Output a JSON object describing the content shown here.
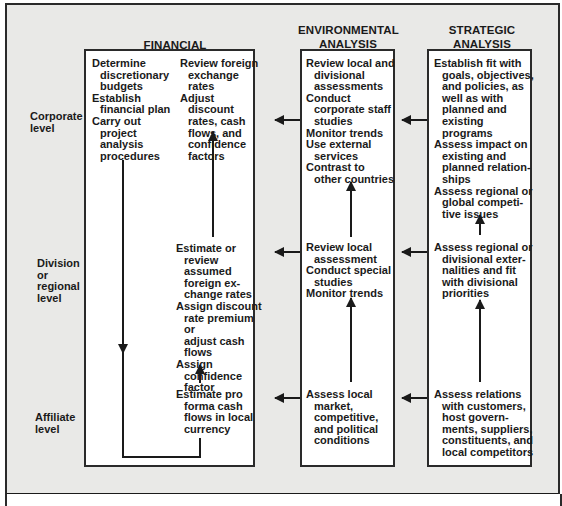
{
  "levels": {
    "corporate": "Corporate\nlevel",
    "division": "Division\nor\nregional\nlevel",
    "affiliate": "Affiliate\nlevel"
  },
  "columns": {
    "financial": {
      "header": "FINANCIAL ANALYSIS",
      "corporate_left": [
        "Determine\ndiscretionary\nbudgets",
        "Establish\nfinancial plan",
        "Carry out\nproject\nanalysis\nprocedures"
      ],
      "corporate_right": [
        "Review foreign\nexchange rates",
        "Adjust discount\nrates, cash\nflows, and\nconfidence\nfactors"
      ],
      "division": [
        "Estimate or\nreview assumed\nforeign ex-\nchange rates",
        "Assign discount\nrate premium or\nadjust cash\nflows",
        "Assign\nconfidence\nfactor"
      ],
      "affiliate": [
        "Estimate pro\nforma cash\nflows in local\ncurrency"
      ]
    },
    "environmental": {
      "header_line1": "ENVIRONMENTAL",
      "header_line2": "ANALYSIS",
      "corporate": [
        "Review local and\ndivisional\nassessments",
        "Conduct\ncorporate staff\nstudies",
        "Monitor trends",
        "Use external\nservices",
        "Contrast to\nother countries"
      ],
      "division": [
        "Review local\nassessment",
        "Conduct special\nstudies",
        "Monitor trends"
      ],
      "affiliate": [
        "Assess local\nmarket,\ncompetitive,\nand political\nconditions"
      ]
    },
    "strategic": {
      "header_line1": "STRATEGIC",
      "header_line2": "ANALYSIS",
      "corporate": [
        "Establish fit with\ngoals, objectives,\nand policies, as\nwell as with\nplanned and\nexisting\nprograms",
        "Assess impact on\nexisting and\nplanned relation-\nships",
        "Assess regional or\nglobal competi-\ntive issues"
      ],
      "division": [
        "Assess regional or\ndivisional exter-\nnalities and fit\nwith divisional\npriorities"
      ],
      "affiliate": [
        "Assess relations\nwith customers,\nhost govern-\nments, suppliers,\nconstituents, and\nlocal competitors"
      ]
    }
  },
  "colors": {
    "background": "#e9e9e7",
    "box": "#ffffff",
    "ink": "#1a1a1a"
  }
}
